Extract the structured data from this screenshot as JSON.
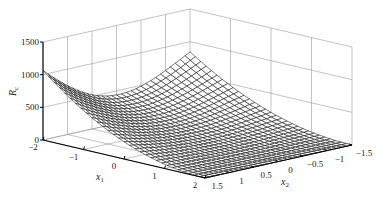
{
  "chart_data": {
    "type": "surface3d",
    "title": "",
    "zlabel": "R_c",
    "xlabel": "x_1",
    "ylabel": "x_2",
    "x1_ticks": [
      "-2",
      "-1",
      "0",
      "1",
      "2"
    ],
    "x2_ticks": [
      "1.5",
      "1",
      "0.5",
      "0",
      "-0.5",
      "-1",
      "-1.5"
    ],
    "z_ticks": [
      "0",
      "500",
      "1000",
      "1500"
    ],
    "x1_range": [
      -2,
      2
    ],
    "x2_range": [
      -1.5,
      1.5
    ],
    "z_range": [
      0,
      1500
    ],
    "grid": true,
    "mesh_resolution": 30,
    "surface_notes": "Mesh surface; value ~1050 at x1=-2 edge near x2=1.5, rises to ~900 at back corner x1=-2..-1.5 far edge x2=-1.5 side peak, near 0 in a curved valley along x2 ≈ x1^2 region; dense black wireframe.",
    "sample_points": [
      {
        "x1": -2,
        "x2": 1.5,
        "z": 1050
      },
      {
        "x1": -2,
        "x2": -1.5,
        "z": 830
      },
      {
        "x1": 2,
        "x2": 1.5,
        "z": 0
      },
      {
        "x1": 2,
        "x2": -1.5,
        "z": 0
      },
      {
        "x1": 0,
        "x2": 0,
        "z": 50
      }
    ]
  },
  "labels": {
    "zlabel_main": "R",
    "zlabel_sub": "c",
    "xlabel_main": "x",
    "xlabel_sub": "1",
    "ylabel_main": "x",
    "ylabel_sub": "2"
  }
}
